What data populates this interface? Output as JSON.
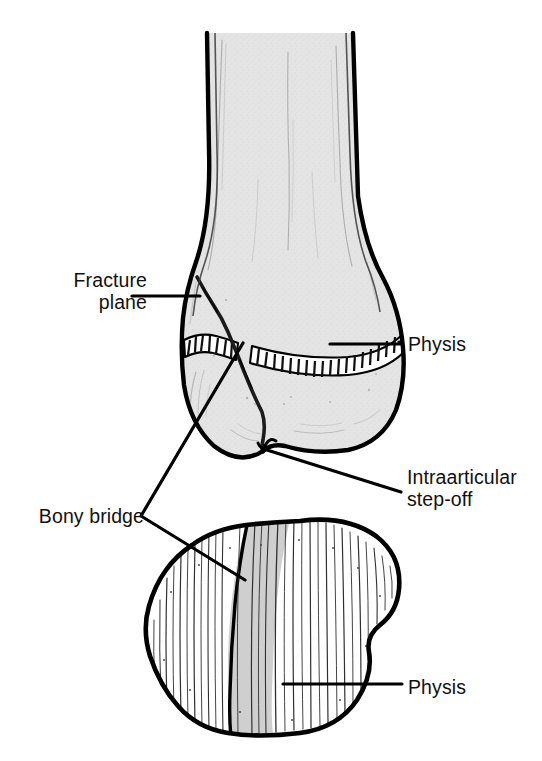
{
  "figure": {
    "kind": "medical-illustration",
    "views": [
      {
        "name": "anteroposterior-view",
        "position": "top"
      },
      {
        "name": "axial-cross-section-view",
        "position": "bottom"
      }
    ]
  },
  "labels": {
    "fracture_plane": "Fracture\nplane",
    "physis_top": "Physis",
    "intraarticular_step_off": "Intraarticular\nstep-off",
    "bony_bridge": "Bony bridge",
    "physis_bottom": "Physis"
  },
  "colors": {
    "ink": "#111111",
    "outline": "#000000",
    "bone_fill": "#e2e2e2",
    "bridge_fill": "#cfcfcf",
    "cartilage": "#ffffff",
    "background": "#ffffff"
  },
  "leaders": {
    "fracture_plane": "horizontal line from text to medial cortex fracture origin",
    "physis_top": "horizontal line from physis band to text",
    "intraarticular_step_off": "diagonal line from articular notch to text",
    "bony_bridge": "V-shaped line from text to physis bridge and to axial bridge band",
    "physis_bottom": "horizontal line from axial striations to text"
  }
}
